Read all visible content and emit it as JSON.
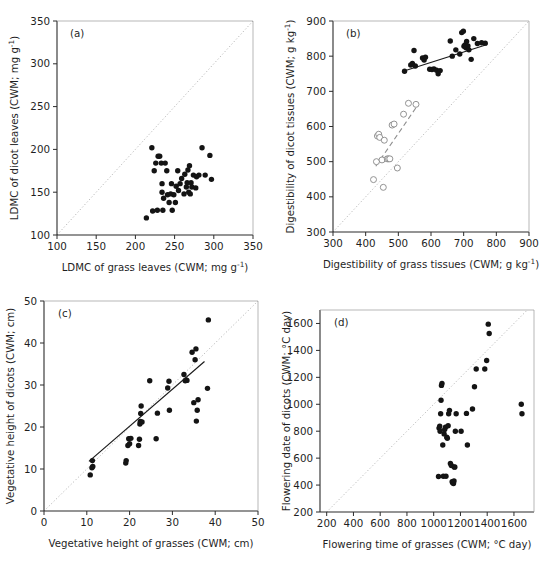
{
  "figure": {
    "background": "#ffffff",
    "point_color": "#141414",
    "open_point_stroke": "#8d8d8d",
    "fit_line_color": "#1a1a1a",
    "oneone_line_color": "#b9b9b9",
    "panel_count": 4
  },
  "chart_data": [
    {
      "type": "scatter",
      "panel": "a",
      "tag": "(a)",
      "title": "",
      "xlabel": "LDMC of grass leaves (CWM; mg g",
      "xlabel_sup": "-1",
      "xlabel_tail": ")",
      "ylabel": "LDMC of dicot leaves (CWM; mg g",
      "ylabel_sup": "-1",
      "ylabel_tail": ")",
      "xlim": [
        100,
        350
      ],
      "ylim": [
        100,
        350
      ],
      "xticks": [
        100,
        150,
        200,
        250,
        300,
        350
      ],
      "yticks": [
        100,
        150,
        200,
        250,
        300,
        350
      ],
      "grid": false,
      "legend": "none",
      "one_to_one_line": true,
      "fit_line": null,
      "series": [
        {
          "name": "dicot vs grass LDMC",
          "marker": "filled-circle",
          "points": [
            [
              214,
              120
            ],
            [
              221,
              202
            ],
            [
              222,
              128
            ],
            [
              224,
              175
            ],
            [
              226,
              184
            ],
            [
              228,
              129
            ],
            [
              229,
              192
            ],
            [
              231,
              192
            ],
            [
              233,
              184
            ],
            [
              234,
              150
            ],
            [
              234,
              160
            ],
            [
              235,
              129
            ],
            [
              236,
              143
            ],
            [
              238,
              184
            ],
            [
              240,
              175
            ],
            [
              241,
              147
            ],
            [
              243,
              138
            ],
            [
              245,
              148
            ],
            [
              246,
              160
            ],
            [
              247,
              129
            ],
            [
              249,
              147
            ],
            [
              251,
              138
            ],
            [
              252,
              157
            ],
            [
              254,
              175
            ],
            [
              255,
              152
            ],
            [
              257,
              160
            ],
            [
              259,
              166
            ],
            [
              262,
              148
            ],
            [
              263,
              171
            ],
            [
              265,
              156
            ],
            [
              266,
              161
            ],
            [
              267,
              176
            ],
            [
              268,
              150
            ],
            [
              269,
              181
            ],
            [
              270,
              148
            ],
            [
              271,
              161
            ],
            [
              272,
              156
            ],
            [
              274,
              170
            ],
            [
              277,
              155
            ],
            [
              278,
              168
            ],
            [
              281,
              170
            ],
            [
              285,
              202
            ],
            [
              289,
              170
            ],
            [
              295,
              193
            ],
            [
              297,
              165
            ]
          ]
        }
      ]
    },
    {
      "type": "scatter",
      "panel": "b",
      "tag": "(b)",
      "title": "",
      "xlabel": "Digestibility of grass tissues (CWM; g kg",
      "xlabel_sup": "-1",
      "xlabel_tail": ")",
      "ylabel": "Digestibility of dicot tissues (CWM; g kg",
      "ylabel_sup": "-1",
      "ylabel_tail": ")",
      "xlim": [
        300,
        900
      ],
      "ylim": [
        300,
        900
      ],
      "xticks": [
        300,
        400,
        500,
        600,
        700,
        800,
        900
      ],
      "yticks": [
        300,
        400,
        500,
        600,
        700,
        800,
        900
      ],
      "grid": false,
      "legend": "none",
      "one_to_one_line": true,
      "series": [
        {
          "name": "upper group (filled)",
          "marker": "filled-circle",
          "fit_line": {
            "style": "solid",
            "x_start": 515,
            "y_start": 757,
            "x_end": 772,
            "y_end": 833
          },
          "points": [
            [
              519,
              757
            ],
            [
              538,
              775
            ],
            [
              543,
              779
            ],
            [
              548,
              816
            ],
            [
              552,
              772
            ],
            [
              574,
              795
            ],
            [
              579,
              789
            ],
            [
              583,
              797
            ],
            [
              596,
              763
            ],
            [
              603,
              762
            ],
            [
              609,
              764
            ],
            [
              617,
              760
            ],
            [
              622,
              750
            ],
            [
              628,
              759
            ],
            [
              659,
              843
            ],
            [
              665,
              800
            ],
            [
              676,
              818
            ],
            [
              688,
              806
            ],
            [
              694,
              867
            ],
            [
              699,
              871
            ],
            [
              701,
              828
            ],
            [
              704,
              832
            ],
            [
              707,
              824
            ],
            [
              709,
              842
            ],
            [
              713,
              829
            ],
            [
              716,
              818
            ],
            [
              723,
              791
            ],
            [
              731,
              850
            ],
            [
              742,
              836
            ],
            [
              755,
              838
            ],
            [
              766,
              837
            ]
          ]
        },
        {
          "name": "lower group (open)",
          "marker": "open-circle",
          "fit_line": {
            "style": "dashed",
            "x_start": 431,
            "y_start": 487,
            "x_end": 559,
            "y_end": 660
          },
          "points": [
            [
              424,
              449
            ],
            [
              433,
              500
            ],
            [
              436,
              573
            ],
            [
              440,
              578
            ],
            [
              443,
              569
            ],
            [
              450,
              505
            ],
            [
              454,
              427
            ],
            [
              457,
              561
            ],
            [
              466,
              508
            ],
            [
              470,
              508
            ],
            [
              474,
              508
            ],
            [
              481,
              604
            ],
            [
              487,
              607
            ],
            [
              497,
              482
            ],
            [
              516,
              635
            ],
            [
              531,
              666
            ],
            [
              554,
              663
            ]
          ]
        }
      ]
    },
    {
      "type": "scatter",
      "panel": "c",
      "tag": "(c)",
      "title": "",
      "xlabel": "Vegetative height of grasses (CWM; cm)",
      "xlabel_sup": "",
      "xlabel_tail": "",
      "ylabel": "Vegetative height of dicots (CWM; cm)",
      "ylabel_sup": "",
      "ylabel_tail": "",
      "xlim": [
        0,
        50
      ],
      "ylim": [
        0,
        50
      ],
      "xticks": [
        0,
        10,
        20,
        30,
        40,
        50
      ],
      "yticks": [
        0,
        10,
        20,
        30,
        40,
        50
      ],
      "grid": false,
      "legend": "none",
      "one_to_one_line": true,
      "fit_line": {
        "style": "solid",
        "x_start": 10.5,
        "y_start": 11.8,
        "x_end": 37.5,
        "y_end": 35.6
      },
      "series": [
        {
          "name": "dicot vs grass height",
          "marker": "filled-circle",
          "points": [
            [
              10.8,
              8.6
            ],
            [
              11.2,
              10.3
            ],
            [
              11.3,
              12.0
            ],
            [
              11.4,
              10.6
            ],
            [
              19.1,
              11.4
            ],
            [
              19.2,
              12.0
            ],
            [
              19.6,
              15.6
            ],
            [
              19.8,
              17.2
            ],
            [
              20.0,
              16.0
            ],
            [
              20.3,
              17.3
            ],
            [
              22.1,
              15.6
            ],
            [
              22.3,
              17.1
            ],
            [
              22.4,
              20.7
            ],
            [
              22.5,
              21.3
            ],
            [
              22.6,
              23.2
            ],
            [
              22.7,
              25.0
            ],
            [
              22.9,
              21.2
            ],
            [
              24.7,
              31.0
            ],
            [
              26.2,
              17.2
            ],
            [
              26.5,
              23.3
            ],
            [
              28.9,
              29.3
            ],
            [
              29.2,
              30.9
            ],
            [
              29.3,
              24.0
            ],
            [
              32.7,
              32.5
            ],
            [
              33.0,
              31.0
            ],
            [
              33.2,
              31.2
            ],
            [
              33.4,
              31.1
            ],
            [
              34.6,
              37.8
            ],
            [
              35.0,
              25.8
            ],
            [
              35.3,
              36.0
            ],
            [
              35.5,
              38.6
            ],
            [
              35.6,
              21.4
            ],
            [
              35.8,
              24.0
            ],
            [
              36.0,
              26.5
            ],
            [
              38.2,
              29.2
            ],
            [
              38.4,
              45.5
            ]
          ]
        }
      ]
    },
    {
      "type": "scatter",
      "panel": "d",
      "tag": "(d)",
      "title": "",
      "xlabel": "Flowering time of grasses (CWM; °C day)",
      "xlabel_sup": "",
      "xlabel_tail": "",
      "ylabel": "Flowering date of dicots (CWM; °C day)",
      "ylabel_sup": "",
      "ylabel_tail": "",
      "xlim": [
        150,
        1750
      ],
      "ylim": [
        200,
        1700
      ],
      "xticks": [
        200,
        400,
        600,
        800,
        1000,
        1200,
        1400,
        1600
      ],
      "yticks": [
        200,
        400,
        600,
        800,
        1000,
        1200,
        1400,
        1600
      ],
      "grid": false,
      "legend": "none",
      "one_to_one_line": true,
      "fit_line": null,
      "series": [
        {
          "name": "dicot vs grass flowering",
          "marker": "filled-circle",
          "points": [
            [
              1036,
              464
            ],
            [
              1040,
              823
            ],
            [
              1045,
              838
            ],
            [
              1048,
              800
            ],
            [
              1052,
              930
            ],
            [
              1055,
              1030
            ],
            [
              1058,
              1140
            ],
            [
              1062,
              1155
            ],
            [
              1068,
              697
            ],
            [
              1072,
              465
            ],
            [
              1078,
              780
            ],
            [
              1082,
              812
            ],
            [
              1088,
              830
            ],
            [
              1092,
              465
            ],
            [
              1098,
              755
            ],
            [
              1102,
              748
            ],
            [
              1108,
              840
            ],
            [
              1112,
              930
            ],
            [
              1118,
              955
            ],
            [
              1125,
              560
            ],
            [
              1132,
              545
            ],
            [
              1138,
              425
            ],
            [
              1142,
              418
            ],
            [
              1148,
              412
            ],
            [
              1152,
              430
            ],
            [
              1155,
              533
            ],
            [
              1158,
              535
            ],
            [
              1162,
              800
            ],
            [
              1168,
              930
            ],
            [
              1205,
              800
            ],
            [
              1245,
              932
            ],
            [
              1252,
              697
            ],
            [
              1290,
              965
            ],
            [
              1305,
              1130
            ],
            [
              1318,
              1262
            ],
            [
              1382,
              1262
            ],
            [
              1396,
              1325
            ],
            [
              1408,
              1595
            ],
            [
              1415,
              1525
            ],
            [
              1655,
              1000
            ],
            [
              1660,
              930
            ]
          ]
        }
      ]
    }
  ]
}
